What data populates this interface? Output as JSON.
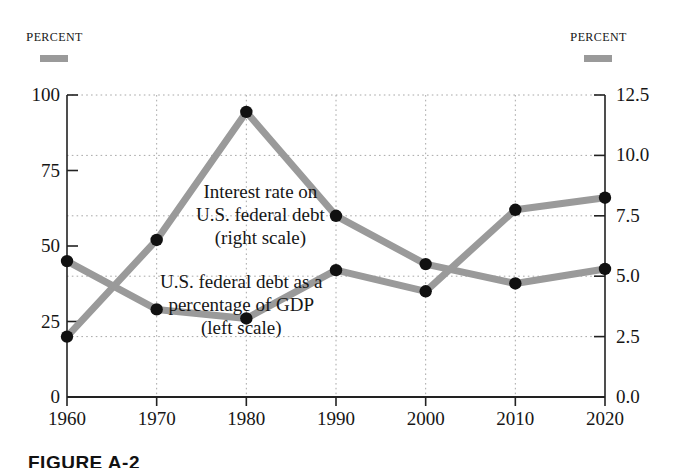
{
  "figure": {
    "caption": "FIGURE A-2",
    "left_axis_title": "PERCENT",
    "right_axis_title": "PERCENT",
    "legend_swatch_color": "#9a9a9a"
  },
  "chart_data": {
    "type": "line",
    "title": "",
    "xlabel": "",
    "grid": true,
    "legend_position": "in-plot-annotations",
    "x": [
      1960,
      1970,
      1980,
      1990,
      2000,
      2010,
      2020
    ],
    "x_tick_labels": [
      "1960",
      "1970",
      "1980",
      "1990",
      "2000",
      "2010",
      "2020"
    ],
    "axes": [
      {
        "id": "left",
        "label": "PERCENT",
        "ylim": [
          0,
          100
        ],
        "ticks": [
          0,
          25,
          50,
          75,
          100
        ],
        "tick_labels": [
          "0",
          "25",
          "50",
          "75",
          "100"
        ]
      },
      {
        "id": "right",
        "label": "PERCENT",
        "ylim": [
          0.0,
          12.5
        ],
        "ticks": [
          0.0,
          2.5,
          5.0,
          7.5,
          10.0,
          12.5
        ],
        "tick_labels": [
          "0.0",
          "2.5",
          "5.0",
          "7.5",
          "10.0",
          "12.5"
        ]
      }
    ],
    "series": [
      {
        "name": "Interest rate on U.S. federal debt",
        "axis": "right",
        "color": "#9a9a9a",
        "marker_color": "#111111",
        "annotation": "Interest rate on\nU.S. federal debt\n(right scale)",
        "values": [
          2.5,
          6.5,
          11.8,
          7.5,
          5.5,
          4.7,
          5.3
        ]
      },
      {
        "name": "U.S. federal debt as a percentage of GDP",
        "axis": "left",
        "color": "#9a9a9a",
        "marker_color": "#111111",
        "annotation": "U.S. federal debt as a\npercentage of GDP\n(left scale)",
        "values": [
          45,
          29,
          26,
          42,
          35,
          62,
          66
        ]
      }
    ]
  },
  "annotations": {
    "interest_rate": {
      "line1": "Interest rate on",
      "line2": "U.S. federal debt",
      "line3": "(right scale)"
    },
    "federal_debt": {
      "line1": "U.S. federal debt as a",
      "line2": "percentage of GDP",
      "line3": "(left scale)"
    }
  }
}
